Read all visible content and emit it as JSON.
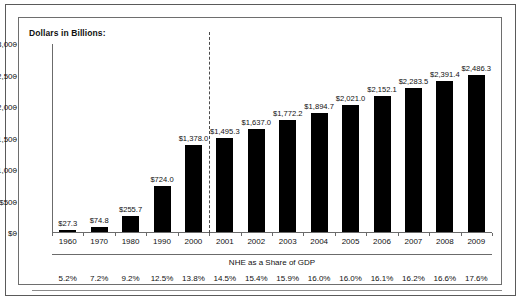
{
  "chart_data": {
    "type": "bar",
    "title": "",
    "ylabel": "Dollars in Billions:",
    "xlabel": "",
    "ylim": [
      0,
      3000
    ],
    "ytick_labels": [
      "$3,000",
      "$2,500",
      "$2,000",
      "$1,500",
      "$1,000",
      "$500",
      "$0"
    ],
    "ytick_values": [
      3000,
      2500,
      2000,
      1500,
      1000,
      500,
      0
    ],
    "grid": false,
    "legend": "none",
    "categories": [
      "1960",
      "1970",
      "1980",
      "1990",
      "2000",
      "2001",
      "2002",
      "2003",
      "2004",
      "2005",
      "2006",
      "2007",
      "2008",
      "2009"
    ],
    "values": [
      27.3,
      74.8,
      255.7,
      724.0,
      1378.0,
      1495.3,
      1637.0,
      1772.2,
      1894.7,
      2021.0,
      2152.1,
      2283.5,
      2391.4,
      2486.3
    ],
    "value_labels": [
      "$27.3",
      "$74.8",
      "$255.7",
      "$724.0",
      "$1,378.0",
      "$1,495.3",
      "$1,637.0",
      "$1,772.2",
      "$1,894.7",
      "$2,021.0",
      "$2,152.1",
      "$2,283.5",
      "$2,391.4",
      "$2,486.3"
    ],
    "secondary_axis_title": "NHE as a Share of GDP",
    "secondary_values": [
      "5.2%",
      "7.2%",
      "9.2%",
      "12.5%",
      "13.8%",
      "14.5%",
      "15.4%",
      "15.9%",
      "16.0%",
      "16.0%",
      "16.1%",
      "16.2%",
      "16.6%",
      "17.6%"
    ],
    "annotations": [
      {
        "type": "vertical-dashed-line",
        "between": [
          "2000",
          "2001"
        ]
      }
    ],
    "colors": {
      "bar": "#000000",
      "axis": "#6b6b6b",
      "background": "#ffffff",
      "divider": "#4a4a4a"
    }
  }
}
